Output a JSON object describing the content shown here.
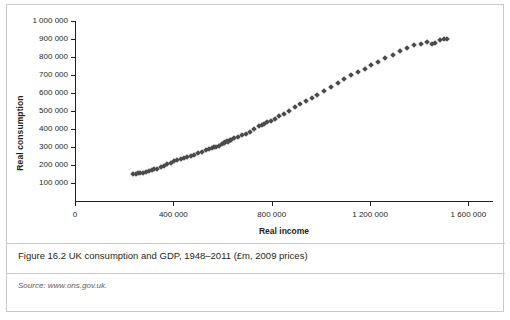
{
  "figure": {
    "caption": "Figure 16.2  UK consumption and GDP, 1948–2011 (£m, 2009 prices)",
    "source_prefix": "Source:",
    "source_text": " www.ons.gov.uk."
  },
  "chart_data": {
    "type": "scatter",
    "title": "",
    "xlabel": "Real income",
    "ylabel": "Real consumption",
    "xlim": [
      0,
      1700000
    ],
    "ylim": [
      0,
      1000000
    ],
    "grid": false,
    "marker": "diamond",
    "marker_color": "#4b4b4b",
    "xticks": [
      0,
      400000,
      800000,
      1200000,
      1600000
    ],
    "xtick_labels": [
      "0",
      "400 000",
      "800 000",
      "1 200 000",
      "1 600 000"
    ],
    "yticks": [
      100000,
      200000,
      300000,
      400000,
      500000,
      600000,
      700000,
      800000,
      900000,
      1000000
    ],
    "ytick_labels": [
      "100 000",
      "200 000",
      "300 000",
      "400 000",
      "500 000",
      "600 000",
      "700 000",
      "800 000",
      "900 000",
      "1 000 000"
    ],
    "series": [
      {
        "name": "UK consumption vs GDP 1948–2011",
        "points": [
          [
            236000,
            150000
          ],
          [
            248000,
            152000
          ],
          [
            258000,
            153000
          ],
          [
            266000,
            154000
          ],
          [
            276000,
            156000
          ],
          [
            288000,
            160000
          ],
          [
            300000,
            166000
          ],
          [
            312000,
            172000
          ],
          [
            322000,
            176000
          ],
          [
            334000,
            180000
          ],
          [
            348000,
            188000
          ],
          [
            360000,
            196000
          ],
          [
            374000,
            204000
          ],
          [
            390000,
            212000
          ],
          [
            404000,
            220000
          ],
          [
            416000,
            226000
          ],
          [
            430000,
            232000
          ],
          [
            444000,
            240000
          ],
          [
            456000,
            244000
          ],
          [
            470000,
            250000
          ],
          [
            486000,
            258000
          ],
          [
            500000,
            264000
          ],
          [
            516000,
            272000
          ],
          [
            534000,
            282000
          ],
          [
            546000,
            290000
          ],
          [
            556000,
            296000
          ],
          [
            566000,
            300000
          ],
          [
            574000,
            302000
          ],
          [
            586000,
            306000
          ],
          [
            598000,
            316000
          ],
          [
            604000,
            322000
          ],
          [
            608000,
            320000
          ],
          [
            612000,
            330000
          ],
          [
            620000,
            332000
          ],
          [
            630000,
            338000
          ],
          [
            624000,
            326000
          ],
          [
            636000,
            340000
          ],
          [
            648000,
            348000
          ],
          [
            662000,
            356000
          ],
          [
            678000,
            364000
          ],
          [
            694000,
            372000
          ],
          [
            712000,
            386000
          ],
          [
            730000,
            400000
          ],
          [
            748000,
            414000
          ],
          [
            760000,
            424000
          ],
          [
            770000,
            430000
          ],
          [
            782000,
            438000
          ],
          [
            796000,
            446000
          ],
          [
            812000,
            456000
          ],
          [
            830000,
            470000
          ],
          [
            850000,
            486000
          ],
          [
            872000,
            502000
          ],
          [
            894000,
            520000
          ],
          [
            916000,
            538000
          ],
          [
            940000,
            556000
          ],
          [
            962000,
            572000
          ],
          [
            986000,
            590000
          ],
          [
            1012000,
            610000
          ],
          [
            1040000,
            632000
          ],
          [
            1068000,
            654000
          ],
          [
            1096000,
            676000
          ],
          [
            1124000,
            698000
          ],
          [
            1150000,
            716000
          ],
          [
            1178000,
            736000
          ],
          [
            1204000,
            754000
          ],
          [
            1232000,
            772000
          ],
          [
            1262000,
            794000
          ],
          [
            1292000,
            812000
          ],
          [
            1320000,
            832000
          ],
          [
            1352000,
            850000
          ],
          [
            1380000,
            866000
          ],
          [
            1408000,
            874000
          ],
          [
            1432000,
            884000
          ],
          [
            1452000,
            872000
          ],
          [
            1466000,
            880000
          ],
          [
            1484000,
            894000
          ],
          [
            1502000,
            898000
          ],
          [
            1512000,
            902000
          ]
        ]
      }
    ]
  }
}
